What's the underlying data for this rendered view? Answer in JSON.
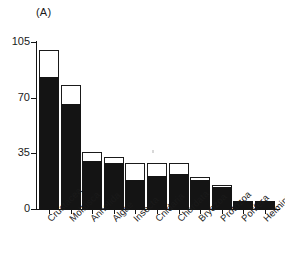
{
  "chart_data": {
    "type": "bar",
    "title": "",
    "panel_label": "(A)",
    "xlabel": "",
    "ylabel": "",
    "ylim": [
      0,
      105
    ],
    "yticks": [
      0,
      35,
      70,
      105
    ],
    "ytick_labels": [
      "0",
      "35",
      "70",
      "105"
    ],
    "grid": false,
    "legend": null,
    "stacked": true,
    "categories": [
      "Crustacea",
      "Mollusca",
      "Annelida",
      "Algae",
      "Insecta",
      "Cnidaria",
      "Chordata",
      "Bryozoa",
      "Protozoa",
      "Porifera",
      "Helminthes"
    ],
    "series": [
      {
        "name": "filled",
        "values": [
          83,
          66,
          30,
          29,
          18,
          21,
          22,
          18,
          14,
          5,
          5
        ]
      },
      {
        "name": "total",
        "values": [
          100,
          78,
          36,
          33,
          29,
          29,
          29,
          20,
          15,
          5,
          5
        ]
      }
    ]
  }
}
